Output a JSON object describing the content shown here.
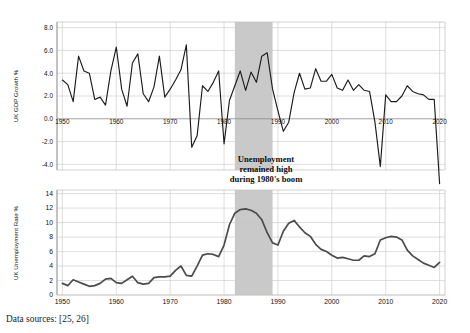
{
  "figure": {
    "background_color": "#ffffff",
    "source_note": "Data sources: [25, 26]",
    "annotation": {
      "line1": "Unemployment",
      "line2": "remained high",
      "line3": "during 1980's boom"
    },
    "highlight_band": {
      "label": "1980's boom",
      "start_year": 1982,
      "end_year": 1989,
      "color": "#c6c6c6"
    }
  },
  "chart_data": [
    {
      "type": "line",
      "title": "",
      "xlabel": "",
      "ylabel": "UK GDP Growth %",
      "xlim": [
        1949,
        2021
      ],
      "ylim": [
        -4.5,
        8.5
      ],
      "xticks": [
        1950,
        1960,
        1970,
        1980,
        1990,
        2000,
        2010,
        2020
      ],
      "xticklabels": [
        "1950",
        "1960",
        "1970",
        "1980",
        "1990",
        "2000",
        "2010",
        "2020"
      ],
      "yticks": [
        -4.0,
        -2.0,
        0.0,
        2.0,
        4.0,
        6.0,
        8.0
      ],
      "yticklabels": [
        "-4.0",
        "-2.0",
        "0.0",
        "2.0",
        "4.0",
        "6.0",
        "8.0"
      ],
      "grid": true,
      "legend": "none",
      "line_color": "#1c1c1c",
      "x": [
        1950,
        1951,
        1952,
        1953,
        1954,
        1955,
        1956,
        1957,
        1958,
        1959,
        1960,
        1961,
        1962,
        1963,
        1964,
        1965,
        1966,
        1967,
        1968,
        1969,
        1970,
        1971,
        1972,
        1973,
        1974,
        1975,
        1976,
        1977,
        1978,
        1979,
        1980,
        1981,
        1982,
        1983,
        1984,
        1985,
        1986,
        1987,
        1988,
        1989,
        1990,
        1991,
        1992,
        1993,
        1994,
        1995,
        1996,
        1997,
        1998,
        1999,
        2000,
        2001,
        2002,
        2003,
        2004,
        2005,
        2006,
        2007,
        2008,
        2009,
        2010,
        2011,
        2012,
        2013,
        2014,
        2015,
        2016,
        2017,
        2018,
        2019,
        2020
      ],
      "values": [
        3.4,
        3.0,
        1.5,
        5.5,
        4.2,
        4.0,
        1.7,
        1.9,
        1.2,
        4.2,
        6.3,
        2.6,
        1.1,
        4.9,
        5.7,
        2.2,
        1.5,
        2.8,
        5.5,
        1.9,
        2.6,
        3.4,
        4.3,
        6.5,
        -2.5,
        -1.5,
        2.9,
        2.4,
        3.2,
        4.2,
        -2.2,
        1.6,
        2.9,
        4.2,
        2.5,
        4.1,
        3.2,
        5.5,
        5.8,
        2.6,
        0.7,
        -1.1,
        -0.3,
        2.3,
        4.0,
        2.6,
        2.7,
        4.4,
        3.3,
        3.3,
        3.9,
        2.7,
        2.5,
        3.4,
        2.5,
        3.0,
        2.5,
        2.4,
        -0.3,
        -4.2,
        2.1,
        1.5,
        1.5,
        2.0,
        2.9,
        2.4,
        2.2,
        2.1,
        1.7,
        1.7,
        -9.7
      ]
    },
    {
      "type": "line",
      "title": "",
      "xlabel": "",
      "ylabel": "UK Unemployment Rate %",
      "xlim": [
        1949,
        2021
      ],
      "ylim": [
        0,
        14.5
      ],
      "xticks": [
        1950,
        1960,
        1970,
        1980,
        1990,
        2000,
        2010,
        2020
      ],
      "xticklabels": [
        "1950",
        "1960",
        "1970",
        "1980",
        "1990",
        "2000",
        "2010",
        "2020"
      ],
      "yticks": [
        0,
        2,
        4,
        6,
        8,
        10,
        12,
        14
      ],
      "yticklabels": [
        "0",
        "2",
        "4",
        "6",
        "8",
        "10",
        "12",
        "14"
      ],
      "grid": true,
      "legend": "none",
      "line_color": "#4b4b4b",
      "x": [
        1950,
        1951,
        1952,
        1953,
        1954,
        1955,
        1956,
        1957,
        1958,
        1959,
        1960,
        1961,
        1962,
        1963,
        1964,
        1965,
        1966,
        1967,
        1968,
        1969,
        1970,
        1971,
        1972,
        1973,
        1974,
        1975,
        1976,
        1977,
        1978,
        1979,
        1980,
        1981,
        1982,
        1983,
        1984,
        1985,
        1986,
        1987,
        1988,
        1989,
        1990,
        1991,
        1992,
        1993,
        1994,
        1995,
        1996,
        1997,
        1998,
        1999,
        2000,
        2001,
        2002,
        2003,
        2004,
        2005,
        2006,
        2007,
        2008,
        2009,
        2010,
        2011,
        2012,
        2013,
        2014,
        2015,
        2016,
        2017,
        2018,
        2019,
        2020
      ],
      "values": [
        1.6,
        1.3,
        2.1,
        1.8,
        1.5,
        1.2,
        1.3,
        1.6,
        2.2,
        2.3,
        1.7,
        1.6,
        2.1,
        2.6,
        1.7,
        1.5,
        1.6,
        2.4,
        2.5,
        2.5,
        2.6,
        3.4,
        4.0,
        2.7,
        2.6,
        4.0,
        5.5,
        5.7,
        5.6,
        5.3,
        6.9,
        9.7,
        11.3,
        11.8,
        11.9,
        11.7,
        11.3,
        10.4,
        8.6,
        7.2,
        6.9,
        8.8,
        9.9,
        10.3,
        9.4,
        8.6,
        8.1,
        7.0,
        6.3,
        6.0,
        5.5,
        5.1,
        5.2,
        5.0,
        4.8,
        4.8,
        5.4,
        5.3,
        5.7,
        7.6,
        7.9,
        8.1,
        8.0,
        7.6,
        6.2,
        5.4,
        4.9,
        4.4,
        4.1,
        3.8,
        4.5
      ]
    }
  ]
}
